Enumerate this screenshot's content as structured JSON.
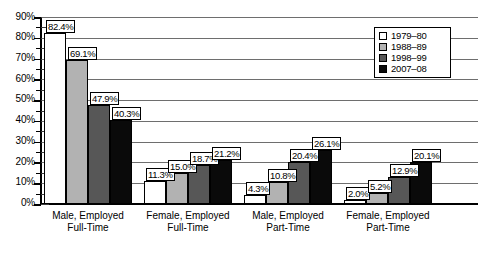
{
  "chart_data": {
    "type": "bar",
    "title": "",
    "subtitle": "",
    "xlabel": "",
    "ylabel": "",
    "ylim": [
      0,
      90
    ],
    "y_tick_step": 10,
    "y_minor_step": 5,
    "grid": true,
    "grid_axis": "y",
    "legend_position": "top-right",
    "value_labels": true,
    "value_label_suffix": "%",
    "categories": [
      "Male, Employed Full-Time",
      "Female, Employed Full-Time",
      "Male, Employed Part-Time",
      "Female, Employed Part-Time"
    ],
    "category_lines": [
      [
        "Male, Employed",
        "Full-Time"
      ],
      [
        "Female, Employed",
        "Full-Time"
      ],
      [
        "Male, Employed",
        "Part-Time"
      ],
      [
        "Female, Employed",
        "Part-Time"
      ]
    ],
    "y_tick_labels": [
      "90%",
      "80%",
      "70%",
      "60%",
      "50%",
      "40%",
      "30%",
      "20%",
      "10%",
      "0%"
    ],
    "y_tick_values": [
      90,
      80,
      70,
      60,
      50,
      40,
      30,
      20,
      10,
      0
    ],
    "series": [
      {
        "name": "1979–80",
        "color": "#ffffff",
        "values": [
          82.4,
          11.3,
          4.3,
          2.0
        ],
        "labels": [
          "82.4%",
          "11.3%",
          "4.3%",
          "2.0%"
        ]
      },
      {
        "name": "1988–89",
        "color": "#b2b2b2",
        "values": [
          69.1,
          15.0,
          10.8,
          5.2
        ],
        "labels": [
          "69.1%",
          "15.0%",
          "10.8%",
          "5.2%"
        ]
      },
      {
        "name": "1998–99",
        "color": "#575757",
        "values": [
          47.9,
          18.7,
          20.4,
          12.9
        ],
        "labels": [
          "47.9%",
          "18.7%",
          "20.4%",
          "12.9%"
        ]
      },
      {
        "name": "2007–08",
        "color": "#0a0a0a",
        "values": [
          40.3,
          21.2,
          26.1,
          20.1
        ],
        "labels": [
          "40.3%",
          "21.2%",
          "26.1%",
          "20.1%"
        ]
      }
    ]
  },
  "legend": {
    "items": [
      {
        "label": "1979–80",
        "swatch": "white"
      },
      {
        "label": "1988–89",
        "swatch": "light-gray"
      },
      {
        "label": "1998–99",
        "swatch": "dark-gray"
      },
      {
        "label": "2007–08",
        "swatch": "black"
      }
    ]
  },
  "axis": {
    "y_labels": [
      "90%",
      "80%",
      "70%",
      "60%",
      "50%",
      "40%",
      "30%",
      "20%",
      "10%",
      "0%"
    ]
  }
}
